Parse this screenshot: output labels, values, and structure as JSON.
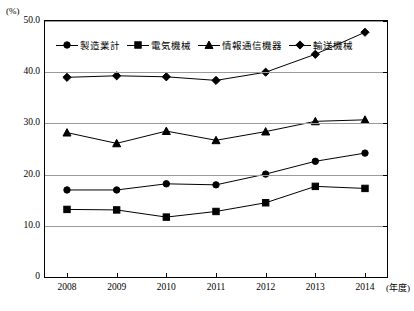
{
  "chart_data": {
    "type": "line",
    "title": "",
    "xlabel": "(年度)",
    "ylabel": "(%)",
    "x": [
      "2008",
      "2009",
      "2010",
      "2011",
      "2012",
      "2013",
      "2014"
    ],
    "categories": [
      "2008",
      "2009",
      "2010",
      "2011",
      "2012",
      "2013",
      "2014"
    ],
    "ylim": [
      0,
      50
    ],
    "yticks": [
      0,
      10,
      20,
      30,
      40,
      50
    ],
    "ytick_labels": [
      "0",
      "10.0",
      "20.0",
      "30.0",
      "40.0",
      "50.0"
    ],
    "grid": true,
    "legend_position": "top-left-inside",
    "series": [
      {
        "name": "製造業計",
        "marker": "circle",
        "values": [
          17.0,
          17.0,
          18.2,
          18.0,
          20.1,
          22.6,
          24.2
        ]
      },
      {
        "name": "電気機械",
        "marker": "square",
        "values": [
          13.2,
          13.1,
          11.7,
          12.8,
          14.5,
          17.7,
          17.3
        ]
      },
      {
        "name": "情報通信機器",
        "marker": "triangle",
        "values": [
          28.2,
          26.1,
          28.5,
          26.7,
          28.4,
          30.4,
          30.7
        ]
      },
      {
        "name": "輸送機械",
        "marker": "diamond",
        "values": [
          39.0,
          39.3,
          39.1,
          38.4,
          40.0,
          43.5,
          47.8
        ]
      }
    ]
  }
}
